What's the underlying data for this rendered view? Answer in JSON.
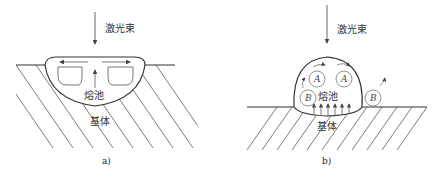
{
  "panels": [
    {
      "id": "a",
      "caption": "a)",
      "beam_label": "激光束",
      "pool_label": "熔池",
      "substrate_label": "基体"
    },
    {
      "id": "b",
      "caption": "b)",
      "beam_label": "激光束",
      "pool_label": "熔池",
      "substrate_label": "基体",
      "vortex_labels": [
        "A",
        "A",
        "B",
        "B"
      ]
    }
  ],
  "colors": {
    "line": "#333333",
    "flow": "#555555",
    "background": "#ffffff"
  }
}
